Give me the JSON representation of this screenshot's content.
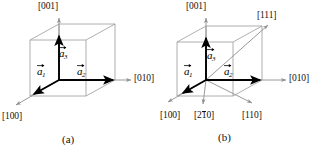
{
  "figure": {
    "type": "crystallography-direction-diagram",
    "panels": [
      {
        "id": "a",
        "caption": "(a)",
        "cube": {
          "shown": true,
          "style": "wireframe-outline"
        },
        "basis_vectors": [
          {
            "name": "a1",
            "label_base": "a",
            "label_sub": "1",
            "direction": "[100]",
            "draw": "down-left"
          },
          {
            "name": "a2",
            "label_base": "a",
            "label_sub": "2",
            "direction": "[010]",
            "draw": "right"
          },
          {
            "name": "a3",
            "label_base": "a",
            "label_sub": "3",
            "direction": "[001]",
            "draw": "up"
          }
        ],
        "direction_labels": [
          {
            "text": "[001]",
            "overbar": "",
            "position": "top"
          },
          {
            "text": "[010]",
            "overbar": "",
            "position": "right"
          },
          {
            "text": "[100]",
            "overbar": "",
            "position": "bottom-left"
          }
        ]
      },
      {
        "id": "b",
        "caption": "(b)",
        "cube": {
          "shown": true,
          "style": "wireframe-outline"
        },
        "basis_vectors": [
          {
            "name": "a1",
            "label_base": "a",
            "label_sub": "1",
            "direction": "[100]",
            "draw": "down-left"
          },
          {
            "name": "a2",
            "label_base": "a",
            "label_sub": "2",
            "direction": "[010]",
            "draw": "right"
          },
          {
            "name": "a3",
            "label_base": "a",
            "label_sub": "3",
            "direction": "[001]",
            "draw": "up"
          }
        ],
        "direction_labels": [
          {
            "text": "[001]",
            "overbar": "",
            "position": "top"
          },
          {
            "text": "[111]",
            "overbar": "",
            "position": "top-right"
          },
          {
            "text": "[010]",
            "overbar": "",
            "position": "right"
          },
          {
            "text": "[100]",
            "overbar": "",
            "position": "bottom-left"
          },
          {
            "text": "[210]",
            "overbar": "1",
            "position": "bottom-center"
          },
          {
            "text": "[110]",
            "overbar": "",
            "position": "bottom-right"
          }
        ]
      }
    ],
    "colors": {
      "cube_edge": "#9a9a9a",
      "ray": "#8f8f8f",
      "vector": "#000000",
      "text": "#111111",
      "background": "#ffffff"
    }
  },
  "labels": {
    "a_panel": {
      "top": "[001]",
      "right": "[010]",
      "bottom_left": "[100]",
      "caption": "(a)",
      "vec1_base": "a",
      "vec1_sub": "1",
      "vec2_base": "a",
      "vec2_sub": "2",
      "vec3_base": "a",
      "vec3_sub": "3"
    },
    "b_panel": {
      "top": "[001]",
      "top_right": "[111]",
      "right": "[010]",
      "bottom_left": "[100]",
      "bottom_center_pre": "[2",
      "bottom_center_bar": "1",
      "bottom_center_post": "0]",
      "bottom_right": "[110]",
      "caption": "(b)",
      "vec1_base": "a",
      "vec1_sub": "1",
      "vec2_base": "a",
      "vec2_sub": "2",
      "vec3_base": "a",
      "vec3_sub": "3"
    }
  }
}
